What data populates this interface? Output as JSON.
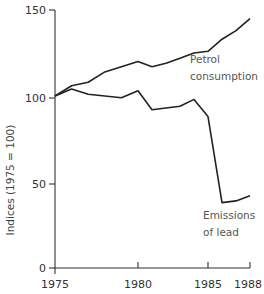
{
  "chart_data": {
    "type": "line",
    "title": "",
    "xlabel": "",
    "ylabel": "Indices (1975 = 100)",
    "x": [
      1975,
      1976,
      1977,
      1978,
      1979,
      1980,
      1981,
      1982,
      1983,
      1984,
      1985,
      1986,
      1987,
      1988
    ],
    "series": [
      {
        "name": "Petrol consumption",
        "values": [
          100,
          106,
          108,
          114,
          117,
          120,
          117,
          119,
          122,
          125,
          126,
          133,
          138,
          145
        ]
      },
      {
        "name": "Emissions of lead",
        "values": [
          100,
          104,
          101,
          100,
          99,
          103,
          92,
          93,
          94,
          98,
          88,
          38,
          39,
          42
        ]
      }
    ],
    "xticks": [
      1975,
      1980,
      1985,
      1988
    ],
    "yticks": [
      0,
      50,
      100,
      150
    ],
    "xlim": [
      1975,
      1988
    ],
    "ylim": [
      0,
      150
    ],
    "grid": false,
    "legend": "inline annotations",
    "annotations": [
      {
        "text": "Petrol",
        "line2": "consumption",
        "series": "Petrol consumption"
      },
      {
        "text": "Emissions",
        "line2": "of lead",
        "series": "Emissions of lead"
      }
    ]
  },
  "labels": {
    "ylabel": "Indices (1975 = 100)",
    "yticks": [
      "0",
      "50",
      "100",
      "150"
    ],
    "xticks": [
      "1975",
      "1980",
      "1985",
      "1988"
    ],
    "petrol_line1": "Petrol",
    "petrol_line2": "consumption",
    "lead_line1": "Emissions",
    "lead_line2": "of lead"
  }
}
